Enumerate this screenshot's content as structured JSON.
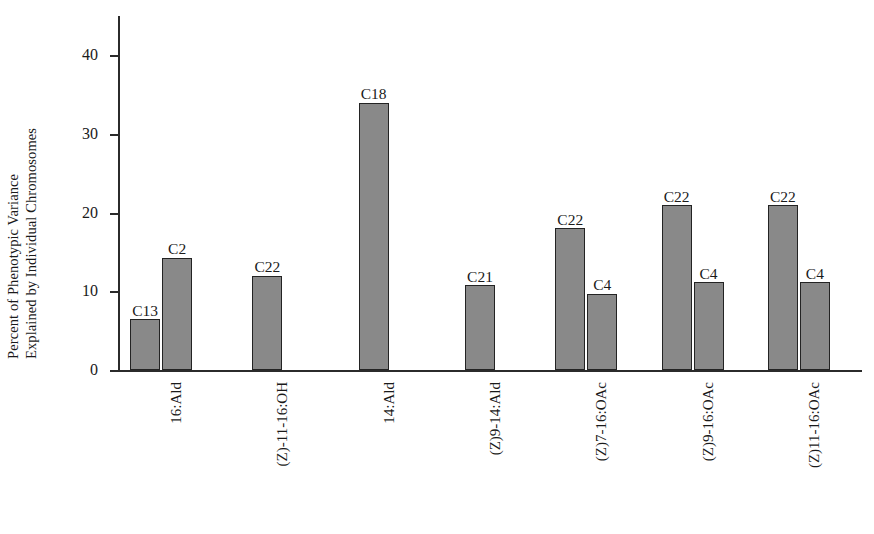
{
  "chart_data": {
    "type": "bar",
    "title": "",
    "subtitle": "",
    "xlabel": "",
    "ylabel": "Percent of Phenotypic Variance Explained by Individual Chromosomes",
    "ylabel_lines": [
      "Percent of Phenotypic Variance",
      "Explained by Individual Chromosomes"
    ],
    "ylim": [
      0,
      45
    ],
    "yticks": [
      0,
      10,
      20,
      30,
      40
    ],
    "ytick_labels": [
      "0",
      "10",
      "20",
      "30",
      "40"
    ],
    "grid": false,
    "legend": null,
    "bar_color": "#898989",
    "bar_edge_color": "#232323",
    "axis_color": "#2b2b2b",
    "categories": [
      "16:Ald",
      "(Z)-11-16:OH",
      "14:Ald",
      "(Z)9-14:Ald",
      "(Z)7-16:OAc",
      "(Z)9-16:OAc",
      "(Z)11-16:OAc"
    ],
    "groups": [
      {
        "category": "16:Ald",
        "bars": [
          {
            "label": "C13",
            "value": 6.5
          },
          {
            "label": "C2",
            "value": 14.3
          }
        ]
      },
      {
        "category": "(Z)-11-16:OH",
        "bars": [
          {
            "label": "C22",
            "value": 12.0
          }
        ]
      },
      {
        "category": "14:Ald",
        "bars": [
          {
            "label": "C18",
            "value": 34.0
          }
        ]
      },
      {
        "category": "(Z)9-14:Ald",
        "bars": [
          {
            "label": "C21",
            "value": 10.8
          }
        ]
      },
      {
        "category": "(Z)7-16:OAc",
        "bars": [
          {
            "label": "C22",
            "value": 18.0
          },
          {
            "label": "C4",
            "value": 9.7
          }
        ]
      },
      {
        "category": "(Z)9-16:OAc",
        "bars": [
          {
            "label": "C22",
            "value": 21.0
          },
          {
            "label": "C4",
            "value": 11.2
          }
        ]
      },
      {
        "category": "(Z)11-16:OAc",
        "bars": [
          {
            "label": "C22",
            "value": 21.0
          },
          {
            "label": "C4",
            "value": 11.2
          }
        ]
      }
    ]
  }
}
